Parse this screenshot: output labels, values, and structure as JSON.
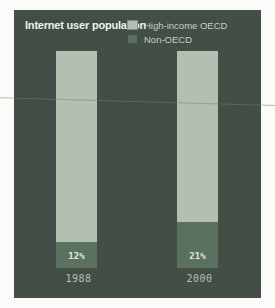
{
  "colors": {
    "page_background": "#fbfbf9",
    "panel_background": "#434e47",
    "high_income_oecd": "#b3bfb1",
    "non_oecd": "#5b7160",
    "title_text": "#eef2ec",
    "legend_text": "#c6cfc4",
    "percent_label_text": "#e3e9e0",
    "year_label_text": "#b6c0b4"
  },
  "chart_data": {
    "type": "bar",
    "stacked": true,
    "title": "Internet user population",
    "categories": [
      "1988",
      "2000"
    ],
    "series": [
      {
        "name": "High-income OECD",
        "values": [
          88,
          79
        ],
        "color": "#b3bfb1"
      },
      {
        "name": "Non-OECD",
        "values": [
          12,
          21
        ],
        "color": "#5b7160"
      }
    ],
    "data_labels": {
      "series": "Non-OECD",
      "labels": [
        "12%",
        "21%"
      ]
    },
    "unit": "%",
    "ylim": [
      0,
      100
    ],
    "grid": false,
    "legend_position": "top-right",
    "axis_visible": false
  }
}
